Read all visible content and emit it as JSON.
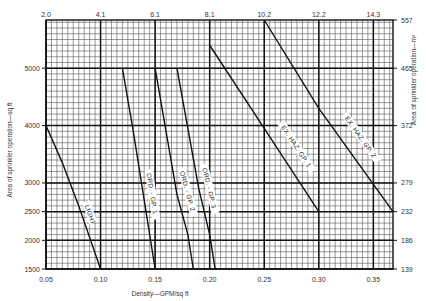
{
  "chart_data": {
    "type": "line",
    "title": "",
    "xlabel": "Density—GPM/sq ft",
    "ylabel": "Area of sprinkler operation—sq ft",
    "x2label": "",
    "y2label": "Area of sprinkler operation—m²",
    "xlim": [
      0.05,
      0.368
    ],
    "ylim": [
      1500,
      5840
    ],
    "grid": true,
    "legend": "none (curve labels inline)",
    "x_ticks": [
      "0.05",
      "0.10",
      "0.15",
      "0.20",
      "0.25",
      "0.30",
      "0.35"
    ],
    "x_tick_values": [
      0.05,
      0.1,
      0.15,
      0.2,
      0.25,
      0.3,
      0.35
    ],
    "x2_ticks": [
      "2.0",
      "4.1",
      "6.1",
      "8.1",
      "10.2",
      "12.2",
      "14.3"
    ],
    "y_ticks": [
      "1500",
      "2000",
      "2500",
      "3000",
      "4000",
      "5000"
    ],
    "y_tick_values": [
      1500,
      2000,
      2500,
      3000,
      4000,
      5000
    ],
    "y2_ticks": [
      "139",
      "186",
      "232",
      "279",
      "372",
      "465",
      "557"
    ],
    "y2_tick_values": [
      1500,
      2000,
      2500,
      3000,
      4000,
      5000,
      5840
    ],
    "series": [
      {
        "name": "LIGHT",
        "points": [
          [
            0.05,
            4000
          ],
          [
            0.065,
            3350
          ],
          [
            0.08,
            2600
          ],
          [
            0.09,
            2050
          ],
          [
            0.1,
            1500
          ]
        ]
      },
      {
        "name": "ORD. - GP. 1",
        "points": [
          [
            0.12,
            5000
          ],
          [
            0.13,
            3900
          ],
          [
            0.14,
            2700
          ],
          [
            0.145,
            2100
          ],
          [
            0.15,
            1500
          ]
        ]
      },
      {
        "name": "ORD. - GP. 2",
        "points": [
          [
            0.15,
            5000
          ],
          [
            0.16,
            3900
          ],
          [
            0.17,
            2800
          ],
          [
            0.18,
            2100
          ],
          [
            0.185,
            1500
          ]
        ]
      },
      {
        "name": "ORD. - GP. 3",
        "points": [
          [
            0.17,
            5000
          ],
          [
            0.18,
            3950
          ],
          [
            0.19,
            2900
          ],
          [
            0.2,
            2100
          ],
          [
            0.205,
            1500
          ]
        ]
      },
      {
        "name": "EX. HAZ. GP. 1",
        "points": [
          [
            0.2,
            5400
          ],
          [
            0.25,
            3950
          ],
          [
            0.3,
            2500
          ]
        ]
      },
      {
        "name": "EX. HAZ. GP. 2",
        "points": [
          [
            0.25,
            5840
          ],
          [
            0.3,
            4300
          ],
          [
            0.368,
            2500
          ]
        ]
      }
    ]
  },
  "plot": {
    "left": 46,
    "right": 393,
    "top": 20,
    "bottom": 269
  }
}
